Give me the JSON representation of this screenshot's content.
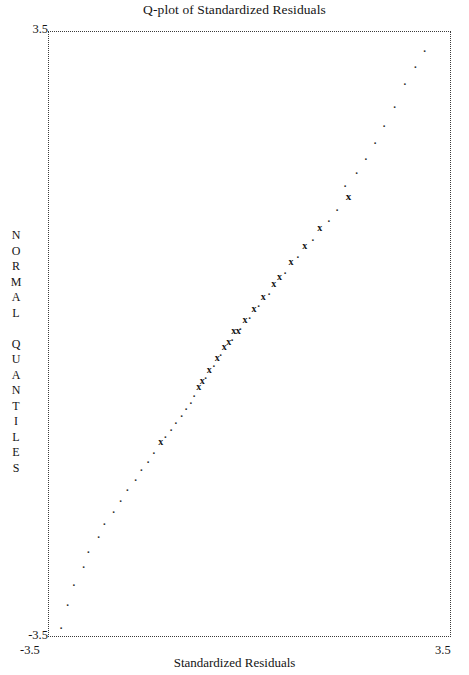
{
  "title": "Q-plot of Standardized Residuals",
  "axes": {
    "x_title": "Standardized Residuals",
    "y_title": "NORMAL QUANTILES",
    "y_title_chars": [
      "N",
      "O",
      "R",
      "M",
      "A",
      "L",
      " ",
      "Q",
      "U",
      "A",
      "N",
      "T",
      "I",
      "L",
      "E",
      "S"
    ],
    "x_tick_left": "-3.5",
    "x_tick_right": "3.5",
    "y_tick_top": "3.5",
    "y_tick_bottom": "-3.5"
  },
  "style": {
    "marker_glyph_x": "x",
    "marker_glyph_xx": "xx",
    "marker_glyph_dot": ".",
    "ink_color": "#141414",
    "axis_color": "#3a3a3a",
    "background": "#ffffff"
  },
  "chart_data": {
    "type": "scatter",
    "title": "Q-plot of Standardized Residuals",
    "xlabel": "Standardized Residuals",
    "ylabel": "NORMAL QUANTILES",
    "xlim": [
      -3.5,
      3.5
    ],
    "ylim": [
      -3.5,
      3.5
    ],
    "grid": false,
    "legend": null,
    "axis_style": "dotted-box",
    "series": [
      {
        "name": "standardized residuals",
        "marker": "x",
        "points": [
          {
            "x": -3.27,
            "y": -3.36,
            "marker": "dot"
          },
          {
            "x": -3.16,
            "y": -3.1,
            "marker": "dot"
          },
          {
            "x": -3.05,
            "y": -2.86,
            "marker": "dot"
          },
          {
            "x": -2.88,
            "y": -2.66,
            "marker": "dot"
          },
          {
            "x": -2.8,
            "y": -2.48,
            "marker": "dot"
          },
          {
            "x": -2.62,
            "y": -2.31,
            "marker": "dot"
          },
          {
            "x": -2.52,
            "y": -2.16,
            "marker": "dot"
          },
          {
            "x": -2.36,
            "y": -2.02,
            "marker": "dot"
          },
          {
            "x": -2.24,
            "y": -1.89,
            "marker": "dot"
          },
          {
            "x": -2.12,
            "y": -1.77,
            "marker": "dot"
          },
          {
            "x": -1.98,
            "y": -1.65,
            "marker": "dot"
          },
          {
            "x": -1.88,
            "y": -1.54,
            "marker": "dot"
          },
          {
            "x": -1.76,
            "y": -1.44,
            "marker": "dot"
          },
          {
            "x": -1.66,
            "y": -1.34,
            "marker": "dot"
          },
          {
            "x": -1.54,
            "y": -1.25,
            "marker": "x"
          },
          {
            "x": -1.46,
            "y": -1.16,
            "marker": "dot"
          },
          {
            "x": -1.36,
            "y": -1.07,
            "marker": "dot"
          },
          {
            "x": -1.28,
            "y": -0.99,
            "marker": "dot"
          },
          {
            "x": -1.18,
            "y": -0.91,
            "marker": "dot"
          },
          {
            "x": -1.1,
            "y": -0.83,
            "marker": "dot"
          },
          {
            "x": -1.02,
            "y": -0.76,
            "marker": "dot"
          },
          {
            "x": -0.96,
            "y": -0.68,
            "marker": "dot"
          },
          {
            "x": -0.88,
            "y": -0.61,
            "marker": "x"
          },
          {
            "x": -0.82,
            "y": -0.54,
            "marker": "x"
          },
          {
            "x": -0.76,
            "y": -0.47,
            "marker": "dot"
          },
          {
            "x": -0.7,
            "y": -0.41,
            "marker": "x"
          },
          {
            "x": -0.62,
            "y": -0.34,
            "marker": "dot"
          },
          {
            "x": -0.56,
            "y": -0.28,
            "marker": "x"
          },
          {
            "x": -0.5,
            "y": -0.21,
            "marker": "dot"
          },
          {
            "x": -0.44,
            "y": -0.15,
            "marker": "x"
          },
          {
            "x": -0.36,
            "y": -0.09,
            "marker": "x"
          },
          {
            "x": -0.3,
            "y": -0.03,
            "marker": "dot"
          },
          {
            "x": -0.24,
            "y": 0.03,
            "marker": "xx"
          },
          {
            "x": -0.16,
            "y": 0.09,
            "marker": "dot"
          },
          {
            "x": -0.08,
            "y": 0.16,
            "marker": "x"
          },
          {
            "x": 0.0,
            "y": 0.22,
            "marker": "dot"
          },
          {
            "x": 0.08,
            "y": 0.29,
            "marker": "x"
          },
          {
            "x": 0.16,
            "y": 0.36,
            "marker": "dot"
          },
          {
            "x": 0.24,
            "y": 0.43,
            "marker": "x"
          },
          {
            "x": 0.34,
            "y": 0.5,
            "marker": "dot"
          },
          {
            "x": 0.42,
            "y": 0.58,
            "marker": "x"
          },
          {
            "x": 0.52,
            "y": 0.66,
            "marker": "x"
          },
          {
            "x": 0.62,
            "y": 0.74,
            "marker": "dot"
          },
          {
            "x": 0.72,
            "y": 0.83,
            "marker": "x"
          },
          {
            "x": 0.84,
            "y": 0.92,
            "marker": "dot"
          },
          {
            "x": 0.96,
            "y": 1.02,
            "marker": "x"
          },
          {
            "x": 1.1,
            "y": 1.12,
            "marker": "dot"
          },
          {
            "x": 1.22,
            "y": 1.23,
            "marker": "x"
          },
          {
            "x": 1.38,
            "y": 1.34,
            "marker": "dot"
          },
          {
            "x": 1.52,
            "y": 1.47,
            "marker": "dot"
          },
          {
            "x": 1.72,
            "y": 1.6,
            "marker": "bold"
          },
          {
            "x": 1.66,
            "y": 1.74,
            "marker": "dot"
          },
          {
            "x": 1.86,
            "y": 1.89,
            "marker": "dot"
          },
          {
            "x": 2.02,
            "y": 2.06,
            "marker": "dot"
          },
          {
            "x": 2.18,
            "y": 2.24,
            "marker": "dot"
          },
          {
            "x": 2.34,
            "y": 2.44,
            "marker": "dot"
          },
          {
            "x": 2.52,
            "y": 2.66,
            "marker": "dot"
          },
          {
            "x": 2.7,
            "y": 2.92,
            "marker": "dot"
          },
          {
            "x": 2.88,
            "y": 3.12,
            "marker": "dot"
          },
          {
            "x": 3.04,
            "y": 3.3,
            "marker": "dot"
          }
        ]
      }
    ]
  }
}
